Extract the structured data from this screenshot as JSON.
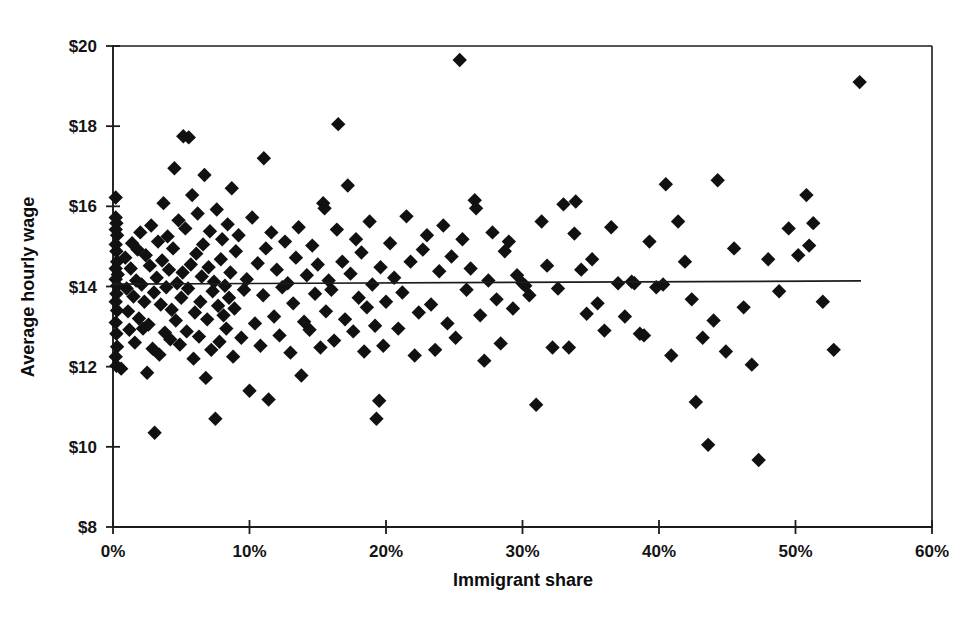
{
  "chart_data": {
    "type": "scatter",
    "title": "",
    "subtitle": "",
    "xlabel": "Immigrant share",
    "ylabel": "Average hourly wage",
    "xlim": [
      0,
      60
    ],
    "ylim": [
      8,
      20
    ],
    "xticks": [
      0,
      10,
      20,
      30,
      40,
      50,
      60
    ],
    "yticks": [
      8,
      10,
      12,
      14,
      16,
      18,
      20
    ],
    "xticklabels": [
      "0%",
      "10%",
      "20%",
      "30%",
      "40%",
      "50%",
      "60%"
    ],
    "yticklabels": [
      "$8",
      "$10",
      "$12",
      "$14",
      "$16",
      "$18",
      "$20"
    ],
    "grid": false,
    "legend": null,
    "legend_position": "none",
    "marker": "diamond",
    "marker_color": "#111111",
    "marker_size": 7.2,
    "annotations": [],
    "series": [
      {
        "name": "Metropolitan areas",
        "points": [
          [
            0.2,
            16.22
          ],
          [
            0.2,
            15.72
          ],
          [
            0.25,
            15.58
          ],
          [
            0.2,
            15.42
          ],
          [
            0.3,
            15.28
          ],
          [
            0.2,
            15.05
          ],
          [
            0.25,
            14.88
          ],
          [
            0.3,
            14.62
          ],
          [
            0.2,
            14.45
          ],
          [
            0.35,
            14.3
          ],
          [
            0.2,
            14.18
          ],
          [
            0.3,
            14.02
          ],
          [
            0.25,
            13.82
          ],
          [
            0.2,
            13.62
          ],
          [
            0.3,
            13.4
          ],
          [
            0.2,
            13.1
          ],
          [
            0.25,
            12.82
          ],
          [
            0.3,
            12.5
          ],
          [
            0.2,
            12.25
          ],
          [
            0.25,
            12.02
          ],
          [
            0.6,
            11.95
          ],
          [
            0.9,
            14.72
          ],
          [
            1.0,
            13.95
          ],
          [
            1.1,
            13.38
          ],
          [
            1.2,
            12.92
          ],
          [
            1.3,
            14.45
          ],
          [
            1.4,
            15.08
          ],
          [
            1.5,
            13.75
          ],
          [
            1.6,
            12.6
          ],
          [
            1.7,
            14.15
          ],
          [
            1.8,
            14.92
          ],
          [
            1.9,
            13.2
          ],
          [
            2.0,
            15.35
          ],
          [
            2.1,
            14.05
          ],
          [
            2.2,
            12.95
          ],
          [
            2.3,
            13.62
          ],
          [
            2.4,
            14.78
          ],
          [
            2.5,
            11.85
          ],
          [
            2.6,
            13.05
          ],
          [
            2.7,
            14.52
          ],
          [
            2.8,
            15.52
          ],
          [
            2.9,
            12.45
          ],
          [
            3.0,
            13.85
          ],
          [
            3.05,
            10.35
          ],
          [
            3.2,
            14.22
          ],
          [
            3.3,
            15.12
          ],
          [
            3.4,
            12.3
          ],
          [
            3.5,
            13.55
          ],
          [
            3.6,
            14.65
          ],
          [
            3.7,
            16.08
          ],
          [
            3.8,
            12.85
          ],
          [
            3.9,
            13.98
          ],
          [
            4.0,
            15.25
          ],
          [
            4.1,
            14.42
          ],
          [
            4.2,
            12.68
          ],
          [
            4.3,
            13.42
          ],
          [
            4.4,
            14.95
          ],
          [
            4.5,
            16.95
          ],
          [
            4.6,
            13.15
          ],
          [
            4.7,
            14.08
          ],
          [
            4.8,
            15.65
          ],
          [
            4.9,
            12.55
          ],
          [
            5.0,
            13.72
          ],
          [
            5.1,
            14.35
          ],
          [
            5.15,
            17.75
          ],
          [
            5.3,
            15.45
          ],
          [
            5.4,
            12.88
          ],
          [
            5.5,
            13.95
          ],
          [
            5.55,
            17.72
          ],
          [
            5.7,
            14.55
          ],
          [
            5.8,
            16.28
          ],
          [
            5.9,
            12.2
          ],
          [
            6.0,
            13.35
          ],
          [
            6.1,
            14.82
          ],
          [
            6.2,
            15.82
          ],
          [
            6.3,
            12.75
          ],
          [
            6.4,
            13.62
          ],
          [
            6.5,
            14.25
          ],
          [
            6.6,
            15.05
          ],
          [
            6.7,
            16.78
          ],
          [
            6.8,
            11.72
          ],
          [
            6.9,
            13.18
          ],
          [
            7.0,
            14.48
          ],
          [
            7.1,
            15.38
          ],
          [
            7.2,
            12.42
          ],
          [
            7.3,
            13.88
          ],
          [
            7.4,
            14.12
          ],
          [
            7.5,
            10.7
          ],
          [
            7.6,
            15.92
          ],
          [
            7.7,
            13.52
          ],
          [
            7.8,
            12.62
          ],
          [
            7.9,
            14.68
          ],
          [
            8.0,
            15.18
          ],
          [
            8.1,
            13.28
          ],
          [
            8.2,
            14.02
          ],
          [
            8.3,
            12.95
          ],
          [
            8.4,
            15.55
          ],
          [
            8.5,
            13.72
          ],
          [
            8.6,
            14.35
          ],
          [
            8.7,
            16.45
          ],
          [
            8.8,
            12.25
          ],
          [
            8.9,
            13.45
          ],
          [
            9.0,
            14.88
          ],
          [
            9.2,
            15.28
          ],
          [
            9.4,
            12.72
          ],
          [
            9.6,
            13.92
          ],
          [
            9.8,
            14.18
          ],
          [
            10.0,
            11.4
          ],
          [
            10.2,
            15.72
          ],
          [
            10.4,
            13.08
          ],
          [
            10.6,
            14.58
          ],
          [
            10.8,
            12.52
          ],
          [
            11.0,
            13.78
          ],
          [
            11.05,
            17.2
          ],
          [
            11.2,
            14.95
          ],
          [
            11.4,
            11.18
          ],
          [
            11.6,
            15.35
          ],
          [
            11.8,
            13.25
          ],
          [
            12.0,
            14.42
          ],
          [
            12.2,
            12.78
          ],
          [
            12.4,
            13.98
          ],
          [
            12.6,
            15.12
          ],
          [
            12.8,
            14.08
          ],
          [
            13.0,
            12.35
          ],
          [
            13.2,
            13.58
          ],
          [
            13.4,
            14.72
          ],
          [
            13.6,
            15.48
          ],
          [
            13.8,
            11.78
          ],
          [
            14.0,
            13.12
          ],
          [
            14.2,
            14.28
          ],
          [
            14.4,
            12.92
          ],
          [
            14.6,
            15.02
          ],
          [
            14.8,
            13.82
          ],
          [
            15.0,
            14.55
          ],
          [
            15.2,
            12.48
          ],
          [
            15.4,
            16.08
          ],
          [
            15.5,
            15.95
          ],
          [
            15.6,
            13.38
          ],
          [
            15.8,
            14.15
          ],
          [
            16.0,
            13.92
          ],
          [
            16.2,
            12.65
          ],
          [
            16.4,
            15.42
          ],
          [
            16.5,
            18.05
          ],
          [
            16.8,
            14.62
          ],
          [
            17.0,
            13.18
          ],
          [
            17.2,
            16.52
          ],
          [
            17.4,
            14.32
          ],
          [
            17.6,
            12.88
          ],
          [
            17.8,
            15.18
          ],
          [
            18.0,
            13.72
          ],
          [
            18.2,
            14.85
          ],
          [
            18.4,
            12.38
          ],
          [
            18.6,
            13.48
          ],
          [
            18.8,
            15.62
          ],
          [
            19.0,
            14.05
          ],
          [
            19.2,
            13.02
          ],
          [
            19.3,
            10.7
          ],
          [
            19.5,
            11.15
          ],
          [
            19.6,
            14.48
          ],
          [
            19.8,
            12.52
          ],
          [
            20.0,
            13.62
          ],
          [
            20.3,
            15.08
          ],
          [
            20.6,
            14.22
          ],
          [
            20.9,
            12.95
          ],
          [
            21.2,
            13.85
          ],
          [
            21.5,
            15.75
          ],
          [
            21.8,
            14.62
          ],
          [
            22.1,
            12.28
          ],
          [
            22.4,
            13.35
          ],
          [
            22.7,
            14.92
          ],
          [
            23.0,
            15.28
          ],
          [
            23.3,
            13.55
          ],
          [
            23.6,
            12.42
          ],
          [
            23.9,
            14.38
          ],
          [
            24.2,
            15.52
          ],
          [
            24.5,
            13.08
          ],
          [
            24.8,
            14.75
          ],
          [
            25.1,
            12.72
          ],
          [
            25.4,
            19.65
          ],
          [
            25.6,
            15.18
          ],
          [
            25.9,
            13.92
          ],
          [
            26.2,
            14.45
          ],
          [
            26.5,
            16.15
          ],
          [
            26.6,
            15.95
          ],
          [
            26.9,
            13.28
          ],
          [
            27.2,
            12.15
          ],
          [
            27.5,
            14.15
          ],
          [
            27.8,
            15.35
          ],
          [
            28.1,
            13.68
          ],
          [
            28.4,
            12.58
          ],
          [
            28.7,
            14.88
          ],
          [
            29.0,
            15.12
          ],
          [
            29.3,
            13.45
          ],
          [
            29.6,
            14.28
          ],
          [
            30.0,
            14.08
          ],
          [
            30.2,
            14.02
          ],
          [
            30.5,
            13.78
          ],
          [
            31.0,
            11.05
          ],
          [
            31.4,
            15.62
          ],
          [
            31.8,
            14.52
          ],
          [
            32.2,
            12.48
          ],
          [
            32.6,
            13.95
          ],
          [
            33.0,
            16.05
          ],
          [
            33.4,
            12.48
          ],
          [
            33.8,
            15.32
          ],
          [
            33.9,
            16.12
          ],
          [
            34.3,
            14.42
          ],
          [
            34.7,
            13.32
          ],
          [
            35.1,
            14.68
          ],
          [
            35.5,
            13.58
          ],
          [
            36.0,
            12.9
          ],
          [
            36.5,
            15.48
          ],
          [
            37.0,
            14.08
          ],
          [
            37.5,
            13.25
          ],
          [
            38.0,
            14.12
          ],
          [
            38.2,
            14.08
          ],
          [
            38.6,
            12.82
          ],
          [
            38.9,
            12.78
          ],
          [
            39.3,
            15.12
          ],
          [
            39.8,
            13.98
          ],
          [
            40.3,
            14.05
          ],
          [
            40.5,
            16.55
          ],
          [
            40.9,
            12.28
          ],
          [
            41.4,
            15.62
          ],
          [
            41.9,
            14.62
          ],
          [
            42.4,
            13.68
          ],
          [
            42.7,
            11.12
          ],
          [
            43.2,
            12.72
          ],
          [
            43.6,
            10.05
          ],
          [
            44.0,
            13.15
          ],
          [
            44.3,
            16.65
          ],
          [
            44.9,
            12.38
          ],
          [
            45.5,
            14.95
          ],
          [
            46.2,
            13.48
          ],
          [
            46.8,
            12.05
          ],
          [
            47.3,
            9.67
          ],
          [
            48.0,
            14.68
          ],
          [
            48.8,
            13.88
          ],
          [
            49.5,
            15.45
          ],
          [
            50.2,
            14.78
          ],
          [
            50.8,
            16.28
          ],
          [
            51.0,
            15.02
          ],
          [
            51.3,
            15.58
          ],
          [
            52.0,
            13.62
          ],
          [
            52.8,
            12.42
          ],
          [
            54.7,
            19.1
          ]
        ]
      }
    ],
    "trendline": {
      "name": "fitted regression line",
      "x_start": 0,
      "x_end": 54.8,
      "y_start": 14.06,
      "y_end": 14.14
    }
  },
  "axes": {
    "x_title": "Immigrant share",
    "y_title": "Average hourly wage"
  }
}
